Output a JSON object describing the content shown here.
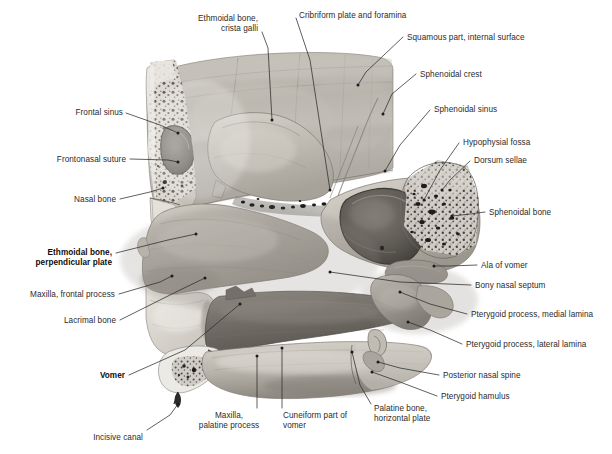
{
  "figure": {
    "domain": "anatomical-illustration",
    "view": "Median (sagittal) section of the skull — lateral wall of the nasal cavity / bony nasal septum",
    "background_color": "#ffffff",
    "ink_color": "#2b2b2b",
    "bone_tone_light": "#d8d4cd",
    "bone_tone_mid": "#a9a49c",
    "bone_tone_dark": "#6f6a63",
    "cavity_shadow": "#4a4641"
  },
  "labels": [
    {
      "id": "ethmoidal-bone-crista-galli",
      "text": "Ethmoidal bone,\ncrista galli",
      "align": "r",
      "bold": false,
      "x": 258,
      "y": 14,
      "leader": [
        [
          262,
          32
        ],
        [
          268,
          48
        ],
        [
          272,
          120
        ]
      ]
    },
    {
      "id": "cribriform-plate-and-foramina",
      "text": "Cribriform plate and foramina",
      "align": "l",
      "bold": false,
      "x": 299,
      "y": 11,
      "leader": [
        [
          296,
          18
        ],
        [
          310,
          60
        ],
        [
          330,
          190
        ]
      ]
    },
    {
      "id": "squamous-part-internal-surface",
      "text": "Squamous part, internal surface",
      "align": "l",
      "bold": false,
      "x": 407,
      "y": 33,
      "leader": [
        [
          403,
          37
        ],
        [
          366,
          72
        ],
        [
          358,
          85
        ]
      ]
    },
    {
      "id": "sphenoidal-crest",
      "text": "Sphenoidal crest",
      "align": "l",
      "bold": false,
      "x": 420,
      "y": 70,
      "leader": [
        [
          416,
          74
        ],
        [
          392,
          94
        ],
        [
          383,
          114
        ]
      ]
    },
    {
      "id": "sphenoidal-sinus",
      "text": "Sphenoidal sinus",
      "align": "l",
      "bold": false,
      "x": 434,
      "y": 105,
      "leader": [
        [
          430,
          110
        ],
        [
          400,
          145
        ],
        [
          385,
          171
        ]
      ]
    },
    {
      "id": "hypophysial-fossa",
      "text": "Hypophysial fossa",
      "align": "l",
      "bold": false,
      "x": 463,
      "y": 138,
      "leader": [
        [
          459,
          143
        ],
        [
          440,
          170
        ],
        [
          424,
          200
        ]
      ]
    },
    {
      "id": "dorsum-sellae",
      "text": "Dorsum sellae",
      "align": "l",
      "bold": false,
      "x": 474,
      "y": 156,
      "leader": [
        [
          470,
          161
        ],
        [
          450,
          180
        ],
        [
          442,
          190
        ]
      ]
    },
    {
      "id": "sphenoidal-bone",
      "text": "Sphenoidal bone",
      "align": "l",
      "bold": false,
      "x": 489,
      "y": 208,
      "leader": [
        [
          485,
          212
        ],
        [
          470,
          214
        ],
        [
          452,
          216
        ]
      ]
    },
    {
      "id": "frontal-sinus",
      "text": "Frontal sinus",
      "align": "r",
      "bold": false,
      "x": 123,
      "y": 108,
      "leader": [
        [
          126,
          113
        ],
        [
          160,
          125
        ],
        [
          178,
          133
        ]
      ]
    },
    {
      "id": "frontonasal-suture",
      "text": "Frontonasal suture",
      "align": "r",
      "bold": false,
      "x": 126,
      "y": 155,
      "leader": [
        [
          130,
          159
        ],
        [
          168,
          160
        ],
        [
          178,
          162
        ]
      ]
    },
    {
      "id": "nasal-bone",
      "text": "Nasal bone",
      "align": "r",
      "bold": false,
      "x": 116,
      "y": 195,
      "leader": [
        [
          120,
          199
        ],
        [
          150,
          192
        ],
        [
          163,
          188
        ]
      ]
    },
    {
      "id": "ethmoidal-bone-perpendicular-plate",
      "text": "Ethmoidal bone,\nperpendicular plate",
      "align": "r",
      "bold": true,
      "x": 112,
      "y": 248,
      "leader": [
        [
          116,
          253
        ],
        [
          168,
          240
        ],
        [
          196,
          234
        ]
      ]
    },
    {
      "id": "maxilla-frontal-process",
      "text": "Maxilla, frontal process",
      "align": "r",
      "bold": false,
      "x": 115,
      "y": 290,
      "leader": [
        [
          119,
          294
        ],
        [
          160,
          282
        ],
        [
          172,
          276
        ]
      ]
    },
    {
      "id": "lacrimal-bone",
      "text": "Lacrimal bone",
      "align": "r",
      "bold": false,
      "x": 116,
      "y": 316,
      "leader": [
        [
          120,
          320
        ],
        [
          180,
          290
        ],
        [
          205,
          278
        ]
      ]
    },
    {
      "id": "vomer",
      "text": "Vomer",
      "align": "r",
      "bold": true,
      "x": 125,
      "y": 371,
      "leader": [
        [
          129,
          375
        ],
        [
          185,
          350
        ],
        [
          240,
          304
        ]
      ]
    },
    {
      "id": "incisive-canal",
      "text": "Incisive canal",
      "align": "r",
      "bold": false,
      "x": 143,
      "y": 433,
      "leader": [
        [
          147,
          430
        ],
        [
          170,
          415
        ],
        [
          178,
          404
        ]
      ]
    },
    {
      "id": "maxilla-palatine-process",
      "text": "Maxilla,\npalatine process",
      "align": "c",
      "bold": false,
      "x": 229,
      "y": 411,
      "leader": [
        [
          257,
          408
        ],
        [
          257,
          390
        ],
        [
          257,
          356
        ]
      ]
    },
    {
      "id": "cuneiform-part-of-vomer",
      "text": "Cuneiform part of\nvomer",
      "align": "l",
      "bold": false,
      "x": 283,
      "y": 411,
      "leader": [
        [
          282,
          408
        ],
        [
          282,
          380
        ],
        [
          282,
          348
        ]
      ]
    },
    {
      "id": "palatine-bone-horizontal-plate",
      "text": "Palatine bone,\nhorizontal plate",
      "align": "l",
      "bold": false,
      "x": 374,
      "y": 404,
      "leader": [
        [
          371,
          404
        ],
        [
          360,
          385
        ],
        [
          352,
          352
        ]
      ]
    },
    {
      "id": "ala-of-vomer",
      "text": "Ala of vomer",
      "align": "l",
      "bold": false,
      "x": 481,
      "y": 261,
      "leader": [
        [
          477,
          265
        ],
        [
          450,
          266
        ],
        [
          434,
          266
        ]
      ]
    },
    {
      "id": "bony-nasal-septum",
      "text": "Bony nasal septum",
      "align": "l",
      "bold": false,
      "x": 475,
      "y": 281,
      "leader": [
        [
          471,
          285
        ],
        [
          400,
          282
        ],
        [
          330,
          272
        ]
      ]
    },
    {
      "id": "pterygoid-process-medial-lamina",
      "text": "Pterygoid process, medial lamina",
      "align": "l",
      "bold": false,
      "x": 471,
      "y": 310,
      "leader": [
        [
          467,
          314
        ],
        [
          430,
          304
        ],
        [
          400,
          292
        ]
      ]
    },
    {
      "id": "pterygoid-process-lateral-lamina",
      "text": "Pterygoid process, lateral lamina",
      "align": "l",
      "bold": false,
      "x": 466,
      "y": 340,
      "leader": [
        [
          462,
          344
        ],
        [
          430,
          330
        ],
        [
          408,
          322
        ]
      ]
    },
    {
      "id": "posterior-nasal-spine",
      "text": "Posterior nasal spine",
      "align": "l",
      "bold": false,
      "x": 443,
      "y": 371,
      "leader": [
        [
          439,
          375
        ],
        [
          400,
          368
        ],
        [
          378,
          362
        ]
      ]
    },
    {
      "id": "pterygoid-hamulus",
      "text": "Pterygoid hamulus",
      "align": "l",
      "bold": false,
      "x": 441,
      "y": 392,
      "leader": [
        [
          437,
          396
        ],
        [
          400,
          382
        ],
        [
          372,
          372
        ]
      ]
    }
  ]
}
